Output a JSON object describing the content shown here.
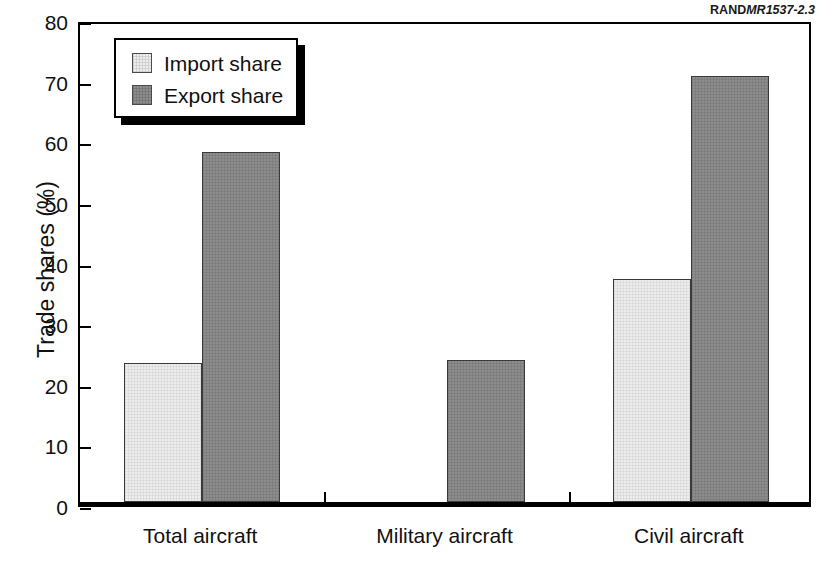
{
  "source_credit": {
    "mark": "RAND",
    "document": "MR1537-2.3"
  },
  "legend": {
    "position": "top-left-inside",
    "entries": [
      {
        "label": "Import share",
        "swatch": "import"
      },
      {
        "label": "Export share",
        "swatch": "export"
      }
    ]
  },
  "colors": {
    "import_fill": "#ededed",
    "export_fill": "#8d8d8d",
    "axis": "#000000",
    "text": "#111111"
  },
  "chart_data": {
    "type": "bar",
    "title": "",
    "subtitle": "",
    "xlabel": "",
    "ylabel": "Trade shares (%)",
    "ylim": [
      0,
      80
    ],
    "yticks": [
      0,
      10,
      20,
      30,
      40,
      50,
      60,
      70,
      80
    ],
    "ytick_labels": [
      "0",
      "10",
      "20",
      "30",
      "40",
      "50",
      "60",
      "70",
      "80"
    ],
    "grid": false,
    "legend_position": "upper left",
    "categories": [
      "Total aircraft",
      "Military aircraft",
      "Civil aircraft"
    ],
    "series": [
      {
        "name": "Import share",
        "values": [
          23.0,
          0,
          36.8
        ]
      },
      {
        "name": "Export share",
        "values": [
          57.8,
          23.4,
          70.2
        ]
      }
    ],
    "annotations": []
  }
}
